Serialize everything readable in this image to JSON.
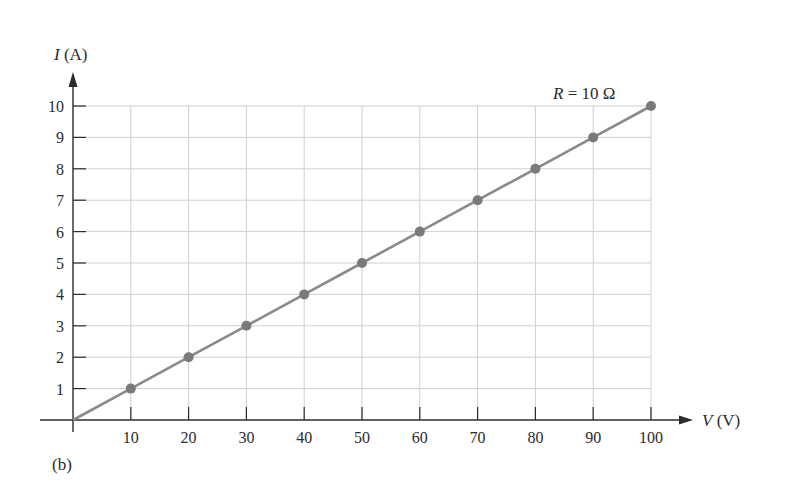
{
  "chart_data": {
    "type": "line",
    "title": "",
    "panel_label": "(b)",
    "annotation": "R = 10 Ω",
    "annotation_parts": {
      "var": "R",
      "rest": " = 10 Ω"
    },
    "xlabel": "V (V)",
    "xlabel_parts": {
      "var": "V",
      "unit": " (V)"
    },
    "ylabel": "I (A)",
    "ylabel_parts": {
      "var": "I",
      "unit": " (A)"
    },
    "xlim": [
      0,
      100
    ],
    "ylim": [
      0,
      10
    ],
    "xticks": [
      10,
      20,
      30,
      40,
      50,
      60,
      70,
      80,
      90,
      100
    ],
    "yticks": [
      1,
      2,
      3,
      4,
      5,
      6,
      7,
      8,
      9,
      10
    ],
    "grid": true,
    "series": [
      {
        "name": "R = 10 Ω",
        "x": [
          0,
          10,
          20,
          30,
          40,
          50,
          60,
          70,
          80,
          90,
          100
        ],
        "y": [
          0,
          1,
          2,
          3,
          4,
          5,
          6,
          7,
          8,
          9,
          10
        ],
        "markers_at": [
          10,
          20,
          30,
          40,
          50,
          60,
          70,
          80,
          90,
          100
        ]
      }
    ]
  },
  "colors": {
    "line": "#8a8a8a",
    "marker": "#7a7a7a",
    "grid": "#cfcfcf",
    "axis": "#2b2b2b",
    "text": "#2b2b2b"
  }
}
